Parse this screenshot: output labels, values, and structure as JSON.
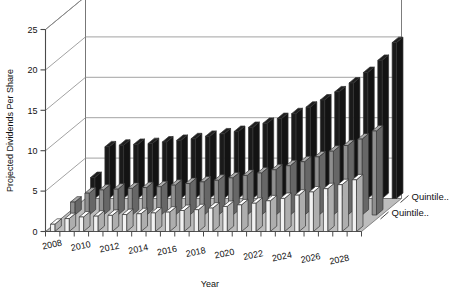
{
  "chart_data": {
    "type": "bar",
    "title": "",
    "xlabel": "Year",
    "ylabel": "Projected Dividends Per Share",
    "zlabel": "",
    "ylim": [
      0,
      25
    ],
    "yticks": [
      0,
      5,
      10,
      15,
      20,
      25
    ],
    "grid": true,
    "projection": "3d",
    "legend_position": "right",
    "categories": [
      2008,
      2009,
      2010,
      2011,
      2012,
      2013,
      2014,
      2015,
      2016,
      2017,
      2018,
      2019,
      2020,
      2021,
      2022,
      2023,
      2024,
      2025,
      2026,
      2027,
      2028,
      2029
    ],
    "xtick_labels": [
      "2008",
      "2010",
      "2012",
      "2014",
      "2016",
      "2018",
      "2020",
      "2022",
      "2024",
      "2026",
      "2028"
    ],
    "series": [
      {
        "name": "Quintile..",
        "color": "#f2f2f2",
        "values": [
          0.9,
          1.6,
          1.8,
          1.9,
          2.0,
          2.1,
          2.2,
          2.3,
          2.4,
          2.6,
          2.7,
          2.9,
          3.1,
          3.3,
          3.5,
          3.8,
          4.1,
          4.5,
          4.9,
          5.3,
          5.8,
          6.4
        ]
      },
      {
        "name": "Quintile..",
        "color": "#8f8f8f",
        "values": [
          1.6,
          2.7,
          3.1,
          3.2,
          3.3,
          3.4,
          3.5,
          3.7,
          3.9,
          4.1,
          4.3,
          4.6,
          4.9,
          5.2,
          5.6,
          6.1,
          6.6,
          7.2,
          7.9,
          8.6,
          9.4,
          10.4
        ]
      },
      {
        "name": "Quintile..",
        "color": "#1a1a1a",
        "values": [
          2.6,
          6.4,
          6.6,
          6.7,
          6.8,
          7.0,
          7.2,
          7.4,
          7.7,
          8.0,
          8.3,
          8.8,
          9.3,
          9.9,
          10.5,
          11.3,
          12.2,
          13.2,
          14.3,
          15.6,
          17.1,
          19.3
        ]
      }
    ],
    "legend_labels": [
      "Quintile..",
      "Quintile.."
    ]
  }
}
